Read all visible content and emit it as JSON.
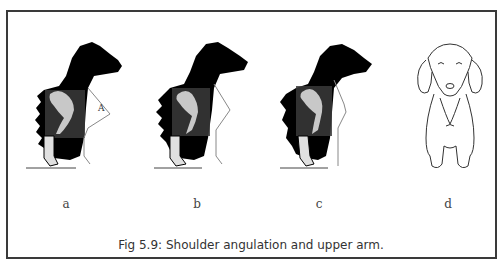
{
  "figure": {
    "caption": "Fig 5.9: Shoulder angulation and upper arm.",
    "panels": [
      {
        "id": "a",
        "label": "a",
        "description": "Dachshund silhouette with well-angulated shoulder; bone overlay and angle marker A"
      },
      {
        "id": "b",
        "label": "b",
        "description": "Dachshund silhouette with moderate shoulder angulation; bone overlay"
      },
      {
        "id": "c",
        "label": "c",
        "description": "Dachshund silhouette with steep shoulder; bone overlay"
      },
      {
        "id": "d",
        "label": "d",
        "description": "Front view line drawing of a Dachshund"
      }
    ],
    "angle_marker": "A"
  },
  "colors": {
    "silhouette": "#000000",
    "bone_overlay_box": "#3a3a3a",
    "bone": "#c8c8c8",
    "line": "#888888",
    "frame": "#3a3a3a"
  }
}
